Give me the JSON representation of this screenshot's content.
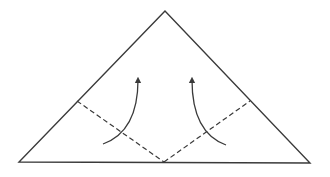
{
  "diagram": {
    "type": "origami-fold",
    "colors": {
      "stroke": "#3a3a3a",
      "background": "#ffffff"
    },
    "triangle": {
      "apex": [
        165,
        11
      ],
      "left": [
        19,
        162
      ],
      "right": [
        310,
        163
      ]
    },
    "fold_lines": [
      {
        "style": "dashed",
        "from": [
          77,
          101
        ],
        "to": [
          164,
          162
        ]
      },
      {
        "style": "dashed",
        "from": [
          164,
          162
        ],
        "to": [
          250,
          101
        ]
      }
    ],
    "arrows": [
      {
        "direction": "up",
        "from": [
          103,
          144
        ],
        "to": [
          138,
          77
        ]
      },
      {
        "direction": "up",
        "from": [
          226,
          145
        ],
        "to": [
          192,
          77
        ]
      }
    ]
  }
}
